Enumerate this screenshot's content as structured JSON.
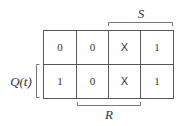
{
  "diagram": {
    "type": "karnaugh-map",
    "rows": [
      {
        "cells": [
          "0",
          "0",
          "X",
          "1"
        ]
      },
      {
        "cells": [
          "1",
          "0",
          "X",
          "1"
        ]
      }
    ],
    "labels": {
      "top": "S",
      "bottom": "R",
      "left": "Q(t)"
    }
  }
}
